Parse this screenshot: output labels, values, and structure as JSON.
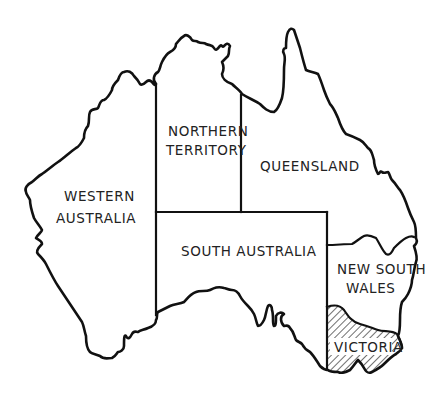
{
  "map": {
    "title": "Australia",
    "regions": [
      {
        "id": "wa",
        "name": "Western Australia",
        "lines": [
          "WESTERN",
          "AUSTRALIA"
        ],
        "hatched": false
      },
      {
        "id": "nt",
        "name": "Northern Territory",
        "lines": [
          "NORTHERN",
          "TERRITORY"
        ],
        "hatched": false
      },
      {
        "id": "qld",
        "name": "Queensland",
        "lines": [
          "QUEENSLAND"
        ],
        "hatched": false
      },
      {
        "id": "sa",
        "name": "South Australia",
        "lines": [
          "SOUTH AUSTRALIA"
        ],
        "hatched": false
      },
      {
        "id": "nsw",
        "name": "New South Wales",
        "lines": [
          "NEW SOUTH",
          "WALES"
        ],
        "hatched": false
      },
      {
        "id": "vic",
        "name": "Victoria",
        "lines": [
          "VICTORIA"
        ],
        "hatched": true
      }
    ],
    "colors": {
      "line": "#111111",
      "text": "#222222",
      "background": "#ffffff"
    }
  }
}
